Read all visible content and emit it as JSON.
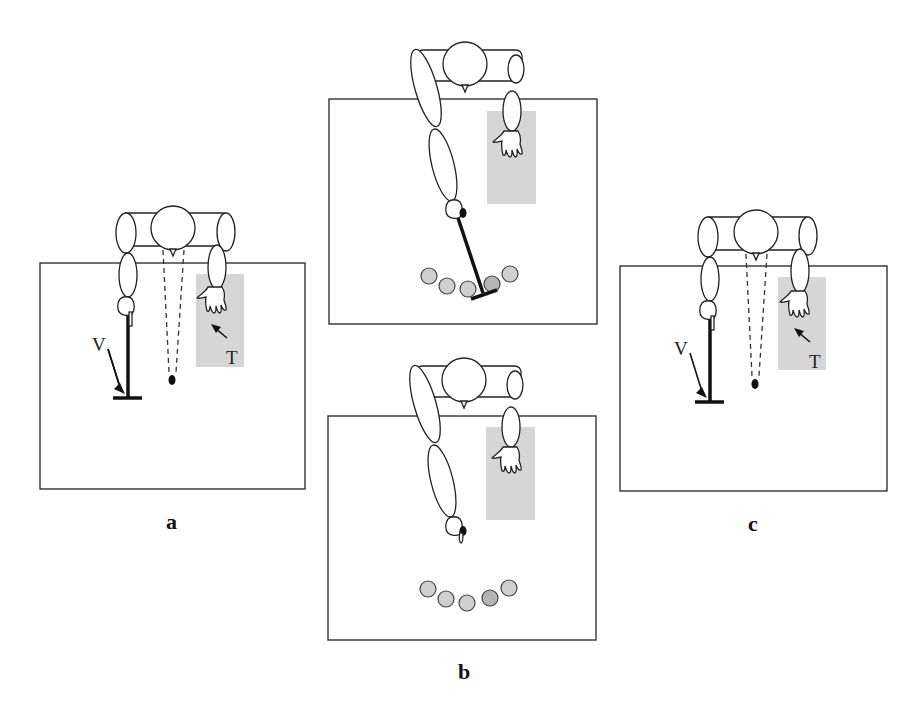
{
  "figure": {
    "panels": [
      {
        "id": "a",
        "label": "a",
        "annotations": {
          "tool_label": "V",
          "target_label": "T"
        },
        "elements": [
          "seated figure (top view)",
          "straight stick tool held in left hand",
          "dashed gaze lines to fixation point",
          "shaded target area under right hand"
        ]
      },
      {
        "id": "b",
        "label": "b",
        "subpanels": [
          {
            "position": "top",
            "elements": [
              "figure reaching with stick tool toward row of five circles",
              "shaded area under right hand"
            ],
            "circle_count": 5
          },
          {
            "position": "bottom",
            "elements": [
              "figure reaching without tool toward row of five circles",
              "shaded area under right hand"
            ],
            "circle_count": 5
          }
        ]
      },
      {
        "id": "c",
        "label": "c",
        "annotations": {
          "tool_label": "V",
          "target_label": "T"
        },
        "elements": [
          "seated figure (top view)",
          "straight stick tool held in left hand",
          "dashed gaze lines to fixation point",
          "shaded target area under right hand"
        ]
      }
    ],
    "colors": {
      "line": "#222222",
      "shade": "#d6d6d6",
      "ball_fill": "#cfcfcf",
      "ball_dark_fill": "#b5b5b5",
      "background": "#ffffff"
    }
  }
}
